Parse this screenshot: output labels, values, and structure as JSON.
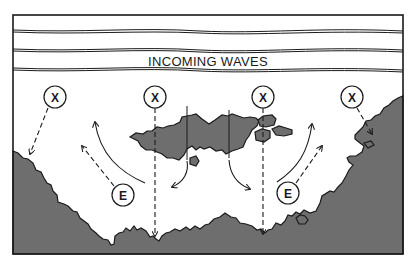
{
  "diagram": {
    "title": "INCOMING WAVES",
    "colors": {
      "land": "#6e6e6e",
      "line": "#1a1a1a",
      "background": "#ffffff"
    },
    "markers": [
      {
        "label": "X",
        "type": "wave-focus",
        "cx": 55,
        "cy": 97
      },
      {
        "label": "X",
        "type": "wave-focus",
        "cx": 155,
        "cy": 97
      },
      {
        "label": "X",
        "type": "wave-focus",
        "cx": 263,
        "cy": 97
      },
      {
        "label": "X",
        "type": "wave-focus",
        "cx": 352,
        "cy": 97
      }
    ],
    "energy_markers": [
      {
        "label": "E",
        "cx": 123,
        "cy": 195
      },
      {
        "label": "E",
        "cx": 288,
        "cy": 193
      }
    ]
  }
}
